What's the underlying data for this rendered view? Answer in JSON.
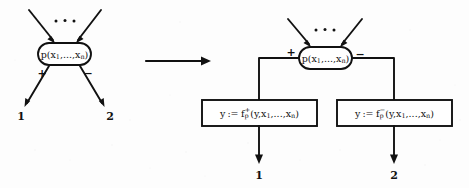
{
  "figure": {
    "type": "transformation-diagram",
    "background_color": "#fdfdfd",
    "ink_color": "#111111",
    "transform_arrow": "→",
    "ellipsis": "• • •",
    "left_side": {
      "name": "predicate-node-before",
      "node_label": "p(x",
      "node_label_sub1": "1",
      "node_label_mid": ",...,x",
      "node_label_sub2": "n",
      "node_label_end": ")",
      "node_label_plain": "p(x₁,...,xₙ)",
      "inputs_ellipsis": "• • •",
      "out_sign_left": "+",
      "out_sign_right": "−",
      "out_terminal_left": "1",
      "out_terminal_right": "2"
    },
    "right_side": {
      "name": "predicate-node-after",
      "node_label_plain": "p(x₁,...,xₙ)",
      "node_label": "p(x",
      "node_label_sub1": "1",
      "node_label_mid": ",...,x",
      "node_label_sub2": "n",
      "node_label_end": ")",
      "inputs_ellipsis": "• • •",
      "out_sign_left": "+",
      "out_sign_right": "−",
      "out_terminal_left": "1",
      "out_terminal_right": "2",
      "boxes": [
        {
          "name": "assignment-box-plus",
          "lhs": "y",
          "assign_op": ":=",
          "fn": "f",
          "fn_sub": "p",
          "fn_sup": "+",
          "args_open": "(y,x",
          "args_sub1": "1",
          "args_mid": ",...,x",
          "args_sub2": "n",
          "args_close": ")",
          "plain": "y := f⁺ₚ(y,x₁,...,xₙ)"
        },
        {
          "name": "assignment-box-minus",
          "lhs": "y",
          "assign_op": ":=",
          "fn": "f",
          "fn_sub": "p",
          "fn_sup": "−",
          "args_open": "(y,x",
          "args_sub1": "1",
          "args_mid": ",...,x",
          "args_sub2": "n",
          "args_close": ")",
          "plain": "y := f⁻ₚ(y,x₁,...,xₙ)"
        }
      ]
    }
  }
}
